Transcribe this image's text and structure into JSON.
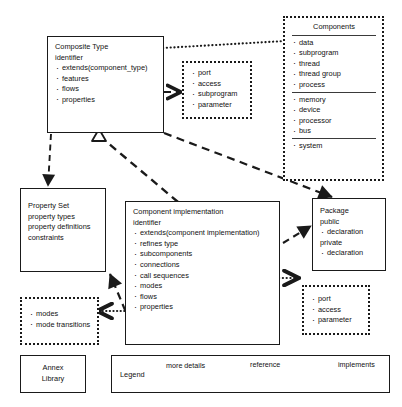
{
  "diagram": {
    "accent_color": "#1a1a1a",
    "background": "#ffffff"
  },
  "nodes": {
    "composite_type": {
      "title": "Composite Type",
      "subtitle": "identifier",
      "items": [
        "extends(component_type)",
        "features",
        "flows",
        "properties"
      ]
    },
    "features_detail": {
      "items": [
        "port",
        "access",
        "subprogram",
        "parameter"
      ]
    },
    "components": {
      "title": "Components",
      "group_1": [
        "data",
        "subprogram",
        "thread",
        "thread group",
        "process"
      ],
      "group_2": [
        "memory",
        "device",
        "processor",
        "bus"
      ],
      "group_3": [
        "system"
      ]
    },
    "property_set": {
      "title": "Property Set",
      "items": [
        "property types",
        "property definitions",
        "constraints"
      ]
    },
    "component_implementation": {
      "title": "Component implementation",
      "subtitle": "identifier",
      "items": [
        "extends(component implementation)",
        "refines type",
        "subcomponents",
        "connections",
        "call sequences",
        "modes",
        "flows",
        "properties"
      ]
    },
    "package": {
      "title": "Package",
      "public_label": "public",
      "public_items": [
        "declaration"
      ],
      "private_label": "private",
      "private_items": [
        "declaration"
      ]
    },
    "modes": {
      "items": [
        "modes",
        "mode transitions"
      ]
    },
    "connections_detail": {
      "items": [
        "port",
        "access",
        "parameter"
      ]
    },
    "annex_library": {
      "line_1": "Annex",
      "line_2": "Library"
    }
  },
  "legend": {
    "label": "Legend",
    "entries": [
      {
        "text": "more details",
        "style": "dotted-arrow"
      },
      {
        "text": "reference",
        "style": "dashed-arrow"
      },
      {
        "text": "implements",
        "style": "dashed-hollow-triangle"
      }
    ]
  }
}
